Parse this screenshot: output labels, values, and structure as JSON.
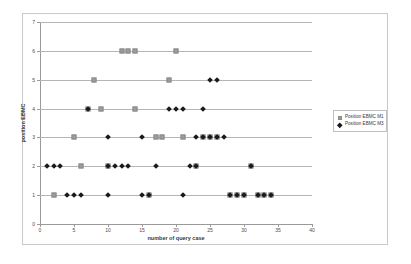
{
  "chart_data": {
    "type": "scatter",
    "title": "",
    "xlabel": "number of query case",
    "ylabel": "position EBMC",
    "xlim": [
      0,
      40
    ],
    "ylim": [
      0,
      7
    ],
    "xticks": [
      0,
      5,
      10,
      15,
      20,
      25,
      30,
      35,
      40
    ],
    "yticks": [
      0,
      1,
      2,
      3,
      4,
      5,
      6,
      7
    ],
    "grid": "horizontal",
    "legend_position": "right",
    "series": [
      {
        "name": "Position EBMC M1",
        "marker": "square",
        "color": "#9c9c9c",
        "points": [
          [
            2,
            1
          ],
          [
            16,
            1
          ],
          [
            28,
            1
          ],
          [
            29,
            1
          ],
          [
            30,
            1
          ],
          [
            32,
            1
          ],
          [
            33,
            1
          ],
          [
            34,
            1
          ],
          [
            6,
            2
          ],
          [
            10,
            2
          ],
          [
            23,
            2
          ],
          [
            31,
            2
          ],
          [
            5,
            3
          ],
          [
            17,
            3
          ],
          [
            18,
            3
          ],
          [
            21,
            3
          ],
          [
            24,
            3
          ],
          [
            25,
            3
          ],
          [
            26,
            3
          ],
          [
            7,
            4
          ],
          [
            9,
            4
          ],
          [
            14,
            4
          ],
          [
            8,
            5
          ],
          [
            19,
            5
          ],
          [
            12,
            6
          ],
          [
            13,
            6
          ],
          [
            14,
            6
          ],
          [
            20,
            6
          ]
        ]
      },
      {
        "name": "Position EBMC M3",
        "marker": "diamond",
        "color": "#1a1a1a",
        "points": [
          [
            4,
            1
          ],
          [
            5,
            1
          ],
          [
            6,
            1
          ],
          [
            10,
            1
          ],
          [
            15,
            1
          ],
          [
            16,
            1
          ],
          [
            21,
            1
          ],
          [
            28,
            1
          ],
          [
            29,
            1
          ],
          [
            30,
            1
          ],
          [
            32,
            1
          ],
          [
            33,
            1
          ],
          [
            34,
            1
          ],
          [
            1,
            2
          ],
          [
            2,
            2
          ],
          [
            3,
            2
          ],
          [
            10,
            2
          ],
          [
            11,
            2
          ],
          [
            12,
            2
          ],
          [
            13,
            2
          ],
          [
            17,
            2
          ],
          [
            22,
            2
          ],
          [
            23,
            2
          ],
          [
            31,
            2
          ],
          [
            10,
            3
          ],
          [
            15,
            3
          ],
          [
            23,
            3
          ],
          [
            24,
            3
          ],
          [
            25,
            3
          ],
          [
            26,
            3
          ],
          [
            27,
            3
          ],
          [
            7,
            4
          ],
          [
            19,
            4
          ],
          [
            20,
            4
          ],
          [
            21,
            4
          ],
          [
            24,
            4
          ],
          [
            25,
            5
          ],
          [
            26,
            5
          ]
        ]
      }
    ]
  },
  "legend": {
    "entries": [
      {
        "label": "Position EBMC M1",
        "marker": "square"
      },
      {
        "label": "Position EBMC M3",
        "marker": "diamond"
      }
    ]
  }
}
